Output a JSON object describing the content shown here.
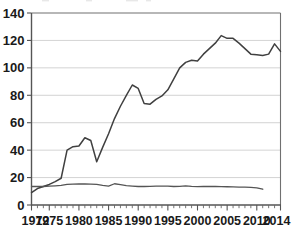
{
  "chart_data": {
    "type": "line",
    "title": "",
    "subtitle": "",
    "xlabel": "",
    "ylabel": "",
    "xlim": [
      1972,
      2014
    ],
    "ylim": [
      0,
      140
    ],
    "grid": true,
    "legend": "none",
    "y_ticks": [
      0,
      20,
      40,
      60,
      80,
      100,
      120,
      140
    ],
    "y_tick_labels": [
      "0",
      "20",
      "40",
      "60",
      "80",
      "100",
      "120",
      "140"
    ],
    "x_ticks": [
      1972,
      1975,
      1980,
      1985,
      1990,
      1995,
      2000,
      2005,
      2010,
      2014
    ],
    "x_tick_labels": [
      "1972",
      "1975",
      "1980",
      "1985",
      "1990",
      "1995",
      "2000",
      "2005",
      "2010",
      "2014"
    ],
    "x_minor_tick_step": 1,
    "series": [
      {
        "name": "upper-series",
        "color": "#404040",
        "x": [
          1972,
          1973,
          1974,
          1975,
          1976,
          1977,
          1978,
          1979,
          1980,
          1981,
          1982,
          1983,
          1984,
          1985,
          1986,
          1987,
          1988,
          1989,
          1990,
          1991,
          1992,
          1993,
          1994,
          1995,
          1996,
          1997,
          1998,
          1999,
          2000,
          2001,
          2002,
          2003,
          2004,
          2005,
          2006,
          2007,
          2008,
          2009,
          2010,
          2011,
          2012,
          2013,
          2014
        ],
        "values": [
          9,
          12,
          13.5,
          15,
          17,
          19.5,
          40,
          42.5,
          43,
          49,
          47,
          31.5,
          42,
          52,
          63,
          72,
          80,
          87.5,
          85,
          74,
          73.5,
          77,
          79.5,
          84,
          92,
          100,
          104,
          105.5,
          105,
          110,
          114,
          118,
          123.5,
          121.5,
          121.5,
          118,
          114,
          110,
          109.5,
          109,
          110,
          117.5,
          112
        ]
      },
      {
        "name": "lower-series",
        "color": "#555555",
        "x": [
          1972,
          1973,
          1974,
          1975,
          1976,
          1977,
          1978,
          1979,
          1980,
          1981,
          1982,
          1983,
          1984,
          1985,
          1986,
          1987,
          1988,
          1989,
          1990,
          1991,
          1992,
          1993,
          1994,
          1995,
          1996,
          1997,
          1998,
          1999,
          2000,
          2001,
          2002,
          2003,
          2004,
          2005,
          2006,
          2007,
          2008,
          2009,
          2010,
          2011
        ],
        "values": [
          13.5,
          13.5,
          13.5,
          13.7,
          14,
          14.3,
          15,
          15.2,
          15.3,
          15.3,
          15.2,
          15,
          14.3,
          13.8,
          15.5,
          14.8,
          14.2,
          13.8,
          13.5,
          13.5,
          13.6,
          13.8,
          13.7,
          13.8,
          13.5,
          13.6,
          14,
          13.6,
          13.4,
          13.5,
          13.6,
          13.5,
          13.4,
          13.3,
          13.2,
          13.1,
          13,
          12.8,
          12.5,
          11.5
        ]
      }
    ]
  },
  "colors": {
    "gridline": "#c8c8c8",
    "axis": "#555555",
    "frame": "#707070",
    "series_primary": "#404040",
    "series_secondary": "#555555",
    "background": "#ffffff",
    "text": "#1a1a1a"
  }
}
